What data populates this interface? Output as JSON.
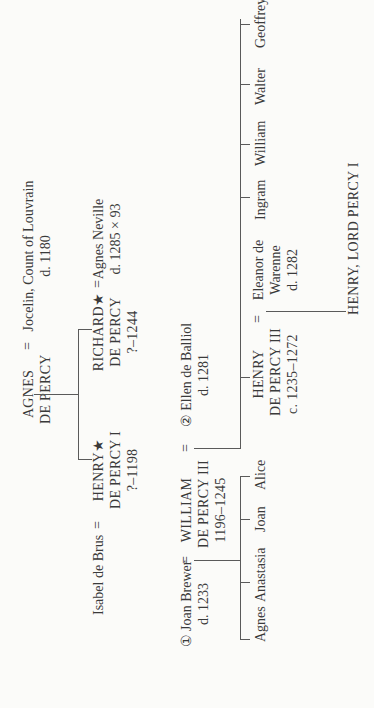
{
  "tree": {
    "gen1": {
      "agnes": {
        "name_line1": "AGNES",
        "name_line2": "DE PERCY"
      },
      "spouse_sign": "=",
      "jocelin": {
        "name": "Jocelin, Count of Louvrain",
        "dates": "d. 1180"
      }
    },
    "gen2": {
      "henry": {
        "name_line1": "HENRY★",
        "name_line2": "DE PERCY I",
        "dates": "?–1198"
      },
      "henry_spouse": {
        "name": "Isabel de Brus"
      },
      "richard": {
        "name_line1": "RICHARD★",
        "name_line2": "DE PERCY",
        "dates": "?–1244"
      },
      "richard_spouse": {
        "name": "Agnes Neville",
        "dates": "d. 1285 × 93"
      },
      "spouse_sign": "="
    },
    "gen3": {
      "william": {
        "name_line1": "WILLIAM",
        "name_line2": "DE PERCY III",
        "dates": "1196–1245"
      },
      "wife1": {
        "name": "① Joan Brewer",
        "dates": "d. 1233"
      },
      "wife2": {
        "name": "② Ellen de Balliol",
        "dates": "d. 1281"
      },
      "spouse_sign": "="
    },
    "gen4": {
      "daughters": [
        "Agnes",
        "Anastasia",
        "Joan",
        "Alice"
      ],
      "henry": {
        "name_line1": "HENRY",
        "name_line2": "DE PERCY III",
        "dates": "c. 1235–1272"
      },
      "henry_spouse": {
        "name_line1": "Eleanor de",
        "name_line2": "Warenne",
        "dates": "d. 1282"
      },
      "spouse_sign": "="
    },
    "gen5": {
      "sons": [
        "Ingram",
        "William",
        "Walter",
        "Geoffrey"
      ],
      "heir": {
        "name": "HENRY, LORD PERCY I"
      }
    }
  }
}
